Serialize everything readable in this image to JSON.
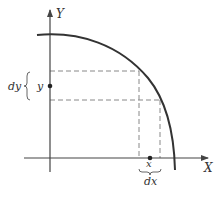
{
  "diagram": {
    "type": "quarter-circle-area-element",
    "colors": {
      "axis": "#444444",
      "curve": "#333333",
      "dashed": "#888888",
      "text": "#333333",
      "point": "#222222"
    },
    "axes": {
      "x_label": "X",
      "y_label": "Y"
    },
    "points": {
      "y_label": "y",
      "x_label": "x"
    },
    "intervals": {
      "dy_label": "dy",
      "dx_label": "dx"
    }
  }
}
